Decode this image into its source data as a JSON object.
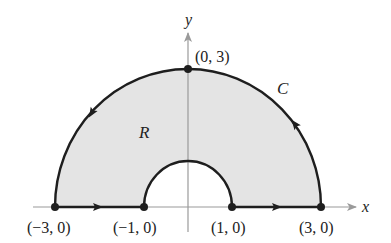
{
  "figure": {
    "type": "region-with-boundary-curve",
    "axes": {
      "x_label": "x",
      "y_label": "y"
    },
    "region_label": "R",
    "curve_label": "C",
    "points": [
      {
        "label": "(−3, 0)",
        "x": -3,
        "y": 0
      },
      {
        "label": "(−1, 0)",
        "x": -1,
        "y": 0
      },
      {
        "label": "(1, 0)",
        "x": 1,
        "y": 0
      },
      {
        "label": "(3, 0)",
        "x": 3,
        "y": 0
      },
      {
        "label": "(0, 3)",
        "x": 0,
        "y": 3
      }
    ],
    "outer_radius": 3,
    "inner_radius": 1,
    "orientation": "counterclockwise",
    "colors": {
      "region_fill": "#e4e4e4",
      "curve": "#1e1e1e",
      "axes": "#9a9a9a"
    }
  }
}
